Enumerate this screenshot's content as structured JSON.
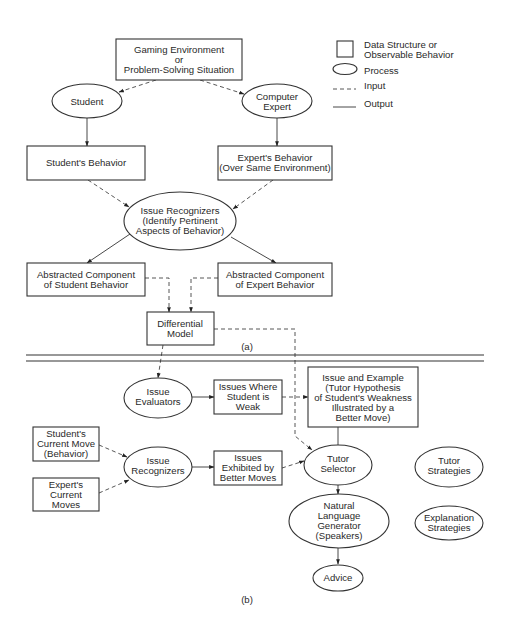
{
  "legend": {
    "data_structure": [
      "Data Structure or",
      "Observable Behavior"
    ],
    "process": "Process",
    "input": "Input",
    "output": "Output"
  },
  "part_a": {
    "label": "(a)",
    "gaming_environment": [
      "Gaming Environment",
      "or",
      "Problem-Solving Situation"
    ],
    "student": "Student",
    "computer_expert": [
      "Computer",
      "Expert"
    ],
    "students_behavior": "Student's Behavior",
    "experts_behavior": [
      "Expert's Behavior",
      "(Over Same Environment)"
    ],
    "issue_recognizers": [
      "Issue Recognizers",
      "(Identify Pertinent",
      "Aspects of Behavior)"
    ],
    "abstracted_student": [
      "Abstracted Component",
      "of Student Behavior"
    ],
    "abstracted_expert": [
      "Abstracted Component",
      "of Expert Behavior"
    ],
    "differential_model": [
      "Differential",
      "Model"
    ]
  },
  "part_b": {
    "label": "(b)",
    "issue_evaluators": [
      "Issue",
      "Evaluators"
    ],
    "issues_weak": [
      "Issues Where",
      "Student is",
      "Weak"
    ],
    "issue_example": [
      "Issue and Example",
      "(Tutor Hypothesis",
      "of Student's Weakness",
      "Illustrated by a",
      "Better Move)"
    ],
    "students_current_move": [
      "Student's",
      "Current Move",
      "(Behavior)"
    ],
    "issue_recognizers": [
      "Issue",
      "Recognizers"
    ],
    "issues_exhibited": [
      "Issues",
      "Exhibited by",
      "Better Moves"
    ],
    "tutor_selector": [
      "Tutor",
      "Selector"
    ],
    "tutor_strategies": [
      "Tutor",
      "Strategies"
    ],
    "experts_current_moves": [
      "Expert's",
      "Current",
      "Moves"
    ],
    "nlg": [
      "Natural",
      "Language",
      "Generator",
      "(Speakers)"
    ],
    "explanation_strategies": [
      "Explanation",
      "Strategies"
    ],
    "advice": "Advice"
  }
}
